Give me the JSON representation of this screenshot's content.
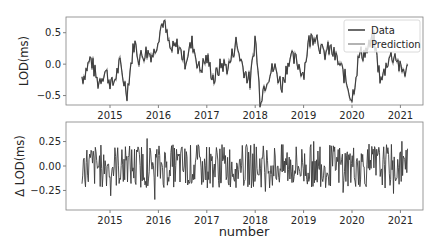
{
  "chart_data": [
    {
      "type": "line",
      "title": "",
      "xlabel": "",
      "ylabel": "LOD(ms)",
      "xticks": [
        "2015",
        "2016",
        "2017",
        "2018",
        "2019",
        "2020",
        "2021"
      ],
      "yticks": [
        "−0.5",
        "0.0",
        "0.5"
      ],
      "ylim": [
        -0.65,
        0.75
      ],
      "xlim": [
        2014.2,
        2021.5
      ],
      "grid": false,
      "legend_position": "upper right",
      "series": [
        {
          "name": "Data",
          "color": "#3a3a3a"
        },
        {
          "name": "Prediction",
          "color": "#9a9a9a"
        }
      ],
      "x": [
        2014.45,
        2014.6,
        2014.75,
        2014.9,
        2015.05,
        2015.2,
        2015.35,
        2015.5,
        2015.6,
        2015.75,
        2015.9,
        2016.0,
        2016.1,
        2016.25,
        2016.4,
        2016.55,
        2016.7,
        2016.85,
        2017.0,
        2017.15,
        2017.3,
        2017.45,
        2017.6,
        2017.75,
        2017.9,
        2018.0,
        2018.1,
        2018.25,
        2018.4,
        2018.55,
        2018.7,
        2018.85,
        2019.0,
        2019.1,
        2019.25,
        2019.4,
        2019.55,
        2019.7,
        2019.85,
        2020.0,
        2020.15,
        2020.3,
        2020.45,
        2020.6,
        2020.75,
        2020.9,
        2021.0
      ],
      "values": [
        -0.2,
        0.1,
        -0.3,
        -0.1,
        -0.35,
        0.0,
        -0.45,
        0.35,
        0.1,
        0.2,
        0.15,
        0.45,
        0.7,
        0.2,
        0.3,
        0.05,
        0.35,
        -0.1,
        0.1,
        -0.25,
        0.0,
        -0.05,
        0.35,
        -0.05,
        -0.3,
        0.45,
        -0.55,
        -0.2,
        -0.05,
        -0.35,
        0.1,
        0.05,
        -0.15,
        0.35,
        0.5,
        0.15,
        0.25,
        0.05,
        -0.2,
        -0.55,
        0.15,
        0.2,
        0.4,
        -0.3,
        0.1,
        0.15,
        -0.1
      ]
    },
    {
      "type": "line",
      "title": "",
      "xlabel": "number",
      "ylabel": "Δ LOD(ms)",
      "xticks": [
        "2015",
        "2016",
        "2017",
        "2018",
        "2019",
        "2020",
        "2021"
      ],
      "yticks": [
        "−0.25",
        "0.00",
        "0.25"
      ],
      "ylim": [
        -0.45,
        0.45
      ],
      "xlim": [
        2014.2,
        2021.5
      ],
      "grid": false,
      "series": [
        {
          "name": "Δ LOD",
          "color": "#3a3a3a"
        }
      ],
      "approx_range": [
        -0.4,
        0.38
      ]
    }
  ]
}
